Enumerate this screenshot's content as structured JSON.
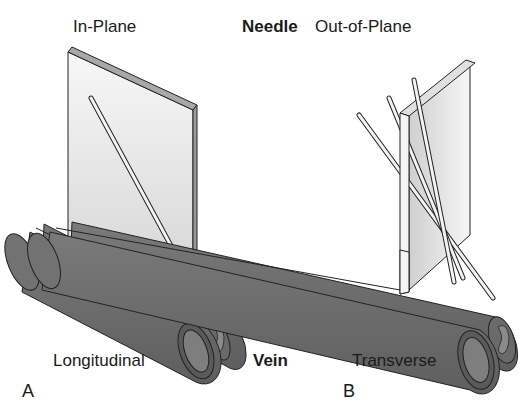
{
  "figure": {
    "center_labels": {
      "top": "Needle",
      "bottom": "Vein"
    },
    "panels": [
      {
        "letter": "A",
        "needle_orientation": "In-Plane",
        "vein_orientation": "Longitudinal"
      },
      {
        "letter": "B",
        "needle_orientation": "Out-of-Plane",
        "vein_orientation": "Transverse"
      }
    ],
    "colors": {
      "vein_fill": "#6e6e6e",
      "vein_dark": "#4a4a4a",
      "plane_fill": "#e6e6e6",
      "plane_edge": "#9a9a9a",
      "needle_fill": "#f2f2f2",
      "outline": "#222222",
      "text": "#1a1a1a"
    }
  }
}
